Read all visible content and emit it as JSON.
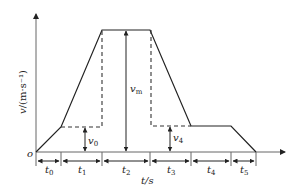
{
  "diagram": {
    "type": "velocity-time trapezoidal profile",
    "axes": {
      "y_label": "v/(m·s⁻¹)",
      "x_label": "t/s",
      "origin_label": "o"
    },
    "velocity_labels": {
      "v0": {
        "base": "v",
        "sub": "0"
      },
      "vm": {
        "base": "v",
        "sub": "m"
      },
      "v4": {
        "base": "v",
        "sub": "4"
      }
    },
    "intervals": [
      {
        "base": "t",
        "sub": "0"
      },
      {
        "base": "t",
        "sub": "1"
      },
      {
        "base": "t",
        "sub": "2"
      },
      {
        "base": "t",
        "sub": "3"
      },
      {
        "base": "t",
        "sub": "4"
      },
      {
        "base": "t",
        "sub": "5"
      }
    ],
    "colors": {
      "line": "#222222",
      "dashed": "#333333",
      "axis": "#555555"
    }
  }
}
